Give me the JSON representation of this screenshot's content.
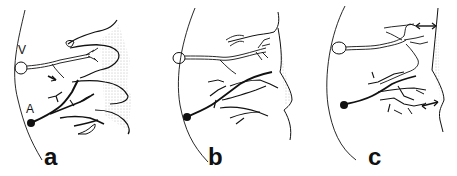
{
  "figure": {
    "panels": [
      {
        "id": "a",
        "label": "a",
        "markers": {
          "vein": "V",
          "artery": "A"
        }
      },
      {
        "id": "b",
        "label": "b"
      },
      {
        "id": "c",
        "label": "c"
      }
    ],
    "colors": {
      "ink": "#111111",
      "stipple": "#888888",
      "background": "#ffffff"
    }
  }
}
